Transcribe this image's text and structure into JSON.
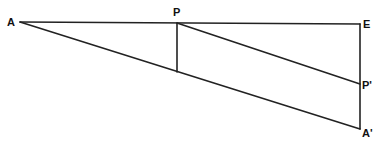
{
  "diagram": {
    "type": "geometric-construction",
    "points": [
      {
        "id": "A",
        "label": "A"
      },
      {
        "id": "P",
        "label": "P"
      },
      {
        "id": "E",
        "label": "E"
      },
      {
        "id": "P_prime",
        "label": "P'"
      },
      {
        "id": "A_prime",
        "label": "A'"
      }
    ],
    "segments": [
      {
        "from": "A",
        "to": "E",
        "description": "top horizontal line through P"
      },
      {
        "from": "A",
        "to": "A_prime",
        "description": "lower slanted line"
      },
      {
        "from": "P",
        "to": "P_prime",
        "description": "slanted line parallel to A-A'"
      },
      {
        "from": "E",
        "to": "A_prime",
        "description": "vertical line through P'"
      },
      {
        "from": "P",
        "to": "foot_on_AA'",
        "description": "vertical drop from P to line A-A'"
      }
    ],
    "line_color": "#222222",
    "background": "#ffffff"
  }
}
